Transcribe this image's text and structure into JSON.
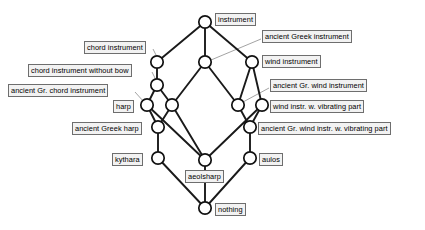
{
  "diagram": {
    "type": "concept-lattice",
    "title": "",
    "node_radius": 6.2,
    "edge_color": "#1a1a1a",
    "node_fill": "#ffffff",
    "node_stroke": "#111111",
    "label_border_color": "#6e6e6e",
    "label_fill_color": "#f2f2f2",
    "leader_color": "#8c8c8c",
    "nodes": [
      {
        "id": "top",
        "label": "instrument",
        "x": 205,
        "y": 22
      },
      {
        "id": "chord",
        "label": "chord instrument",
        "x": 157,
        "y": 62
      },
      {
        "id": "agi",
        "label": "ancient Greek instrument",
        "x": 205,
        "y": 62
      },
      {
        "id": "wind",
        "label": "wind instrument",
        "x": 252,
        "y": 62
      },
      {
        "id": "chordnb",
        "label": "chord instrument without bow",
        "x": 157,
        "y": 85
      },
      {
        "id": "agchord",
        "label": "ancient Gr. chord instrument",
        "x": 147,
        "y": 105
      },
      {
        "id": "harp",
        "label": "harp",
        "x": 147,
        "y": 105
      },
      {
        "id": "harpmid",
        "label": "",
        "x": 172,
        "y": 105
      },
      {
        "id": "agwind",
        "label": "ancient Gr. wind instrument",
        "x": 238,
        "y": 105
      },
      {
        "id": "windvib",
        "label": "wind instr. w. vibrating part",
        "x": 262,
        "y": 105
      },
      {
        "id": "agharp",
        "label": "ancient Greek harp",
        "x": 158,
        "y": 127
      },
      {
        "id": "agwindvib",
        "label": "ancient Gr. wind instr. w. vibrating part",
        "x": 250,
        "y": 127
      },
      {
        "id": "kythara",
        "label": "kythara",
        "x": 158,
        "y": 158
      },
      {
        "id": "aulos",
        "label": "aulos",
        "x": 250,
        "y": 158
      },
      {
        "id": "aeolsharp",
        "label": "aeolsharp",
        "x": 205,
        "y": 160
      },
      {
        "id": "bottom",
        "label": "nothing",
        "x": 205,
        "y": 208
      }
    ],
    "edges": [
      {
        "from": "top",
        "to": "chord"
      },
      {
        "from": "top",
        "to": "agi"
      },
      {
        "from": "top",
        "to": "wind"
      },
      {
        "from": "chord",
        "to": "chordnb"
      },
      {
        "from": "agi",
        "to": "harpmid"
      },
      {
        "from": "agi",
        "to": "agwind"
      },
      {
        "from": "wind",
        "to": "agwind"
      },
      {
        "from": "wind",
        "to": "windvib"
      },
      {
        "from": "chordnb",
        "to": "harp"
      },
      {
        "from": "chordnb",
        "to": "harpmid"
      },
      {
        "from": "harp",
        "to": "agharp"
      },
      {
        "from": "harpmid",
        "to": "agharp"
      },
      {
        "from": "harp",
        "to": "aeolsharp"
      },
      {
        "from": "harpmid",
        "to": "aeolsharp"
      },
      {
        "from": "agwind",
        "to": "agwindvib"
      },
      {
        "from": "windvib",
        "to": "agwindvib"
      },
      {
        "from": "windvib",
        "to": "aeolsharp"
      },
      {
        "from": "agharp",
        "to": "kythara"
      },
      {
        "from": "agwindvib",
        "to": "aulos"
      },
      {
        "from": "aeolsharp",
        "to": "bottom"
      },
      {
        "from": "kythara",
        "to": "bottom"
      },
      {
        "from": "aulos",
        "to": "bottom"
      }
    ],
    "labels": [
      {
        "id": "lbl-instrument",
        "text": "instrument",
        "x": 215,
        "y": 13,
        "leader": null
      },
      {
        "id": "lbl-agi",
        "text": "ancient Greek instrument",
        "x": 262,
        "y": 30,
        "leader": {
          "x1": 261,
          "y1": 39,
          "x2": 211,
          "y2": 60
        }
      },
      {
        "id": "lbl-chord",
        "text": "chord instrument",
        "x": 84,
        "y": 41,
        "leader": {
          "x1": 153,
          "y1": 49,
          "x2": 157,
          "y2": 57
        }
      },
      {
        "id": "lbl-wind",
        "text": "wind instrument",
        "x": 262,
        "y": 55,
        "leader": null
      },
      {
        "id": "lbl-chordnb",
        "text": "chord instrument without bow",
        "x": 28,
        "y": 64,
        "leader": {
          "x1": 152,
          "y1": 72,
          "x2": 156,
          "y2": 80
        }
      },
      {
        "id": "lbl-agwind",
        "text": "ancient Gr. wind instrument",
        "x": 270,
        "y": 79,
        "leader": {
          "x1": 269,
          "y1": 88,
          "x2": 243,
          "y2": 102
        }
      },
      {
        "id": "lbl-agchord",
        "text": "ancient Gr. chord instrument",
        "x": 8,
        "y": 84,
        "leader": {
          "x1": 135,
          "y1": 92,
          "x2": 144,
          "y2": 102
        }
      },
      {
        "id": "lbl-harp",
        "text": "harp",
        "x": 113,
        "y": 100,
        "leader": null
      },
      {
        "id": "lbl-windvib",
        "text": "wind instr. w. vibrating part",
        "x": 270,
        "y": 100,
        "leader": null
      },
      {
        "id": "lbl-agharp",
        "text": "ancient Greek harp",
        "x": 72,
        "y": 122,
        "leader": null
      },
      {
        "id": "lbl-agwindvib",
        "text": "ancient Gr. wind instr. w. vibrating part",
        "x": 258,
        "y": 122,
        "leader": null
      },
      {
        "id": "lbl-kythara",
        "text": "kythara",
        "x": 112,
        "y": 153,
        "leader": null
      },
      {
        "id": "lbl-aulos",
        "text": "aulos",
        "x": 259,
        "y": 153,
        "leader": null
      },
      {
        "id": "lbl-aeolsharp",
        "text": "aeolsharp",
        "x": 185,
        "y": 170,
        "leader": null
      },
      {
        "id": "lbl-nothing",
        "text": "nothing",
        "x": 215,
        "y": 203,
        "leader": null
      }
    ]
  }
}
